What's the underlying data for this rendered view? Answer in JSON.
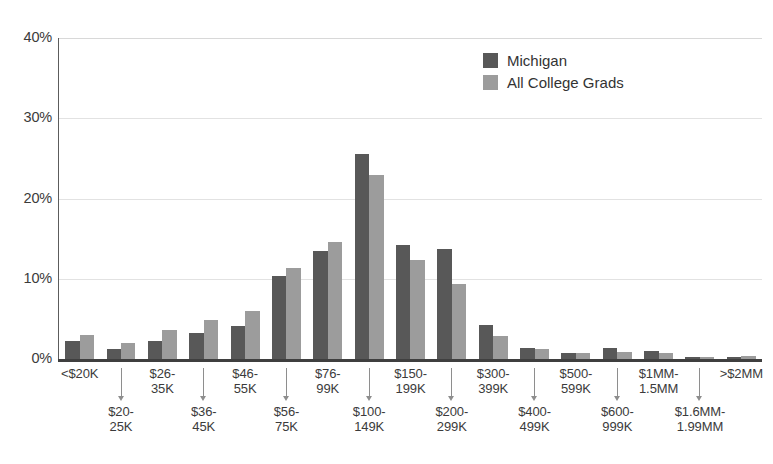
{
  "chart_data": {
    "type": "bar",
    "title": "",
    "subtitle": "",
    "xlabel": "",
    "ylabel": "",
    "ylim": [
      0,
      40
    ],
    "yticks": [
      0,
      10,
      20,
      30,
      40
    ],
    "ytick_labels": [
      "0%",
      "10%",
      "20%",
      "30%",
      "40%"
    ],
    "grid": "horizontal",
    "legend_position": "top-right",
    "colors": {
      "series_0": "#585858",
      "series_1": "#9c9c9c",
      "gridline": "#e2e2e2",
      "axis": "#3f3f3f",
      "text": "#3b3b3b",
      "background": "#ffffff"
    },
    "categories": [
      "<$20K",
      "$20-\n25K",
      "$26-\n35K",
      "$36-\n45K",
      "$46-\n55K",
      "$56-\n75K",
      "$76-\n99K",
      "$100-\n149K",
      "$150-\n199K",
      "$200-\n299K",
      "$300-\n399K",
      "$400-\n499K",
      "$500-\n599K",
      "$600-\n999K",
      "$1MM-\n1.5MM",
      "$1.6MM-\n1.99MM",
      ">$2MM"
    ],
    "series": [
      {
        "name": "Michigan",
        "color": "#585858",
        "values": [
          2.3,
          1.3,
          2.3,
          3.3,
          4.1,
          10.4,
          13.5,
          25.5,
          14.2,
          13.7,
          4.3,
          1.4,
          0.8,
          1.4,
          1.0,
          0.3,
          0.3
        ]
      },
      {
        "name": "All College Grads",
        "color": "#9c9c9c",
        "values": [
          3.0,
          2.0,
          3.6,
          4.9,
          6.0,
          11.3,
          14.6,
          22.9,
          12.4,
          9.4,
          2.9,
          1.3,
          0.7,
          0.9,
          0.7,
          0.3,
          0.4
        ]
      }
    ]
  },
  "legend": {
    "items": [
      {
        "label": "Michigan",
        "color": "#585858"
      },
      {
        "label": "All College Grads",
        "color": "#9c9c9c"
      }
    ]
  },
  "axis": {
    "y_tick_labels": [
      "40%",
      "30%",
      "20%",
      "10%",
      "0%"
    ]
  }
}
